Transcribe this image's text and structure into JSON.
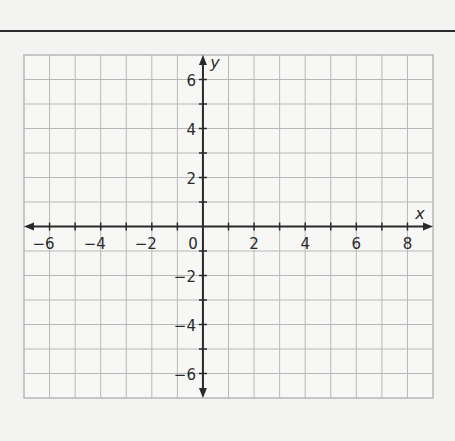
{
  "chart_data": {
    "type": "coordinate-grid",
    "title": "",
    "xlabel": "x",
    "ylabel": "y",
    "xlim": [
      -7,
      9
    ],
    "ylim": [
      -7,
      7
    ],
    "grid": true,
    "x_ticks": [
      -6,
      -4,
      -2,
      2,
      4,
      6,
      8
    ],
    "y_ticks": [
      6,
      4,
      2,
      -2,
      -4,
      -6
    ],
    "origin_label": "0",
    "series": []
  },
  "labels": {
    "x_axis": "x",
    "y_axis": "y",
    "origin": "0",
    "x_tick_labels": [
      "−6",
      "−4",
      "−2",
      "2",
      "4",
      "6",
      "8"
    ],
    "y_tick_labels": [
      "6",
      "4",
      "2",
      "−2",
      "−4",
      "−6"
    ]
  },
  "colors": {
    "grid": "#b8b8b8",
    "axis": "#2a2a2a",
    "background": "#f3f3f1"
  }
}
